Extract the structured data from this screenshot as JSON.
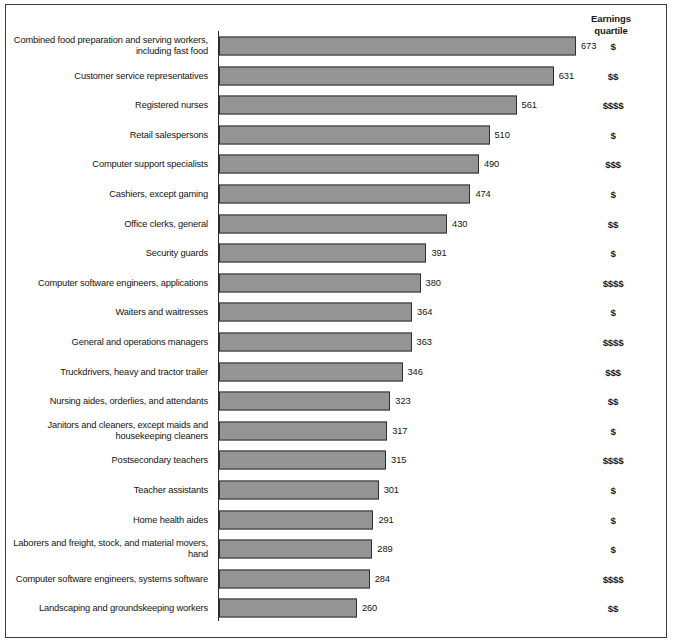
{
  "header": {
    "quartile_column_line1": "Earnings",
    "quartile_column_line2": "quartile"
  },
  "colors": {
    "bar_fill": "#949494",
    "bar_border": "#2f2f2f",
    "frame": "#3c3c3c",
    "text": "#151515"
  },
  "chart_data": {
    "type": "bar",
    "orientation": "horizontal",
    "title": "",
    "xlabel": "",
    "ylabel": "",
    "xlim": [
      0,
      700
    ],
    "grid": false,
    "legend": null,
    "categories": [
      "Combined food preparation and serving workers, including fast food",
      "Customer service representatives",
      "Registered nurses",
      "Retail salespersons",
      "Computer support specialists",
      "Cashiers, except gaming",
      "Office clerks, general",
      "Security guards",
      "Computer software engineers, applications",
      "Waiters and waitresses",
      "General and operations managers",
      "Truckdrivers, heavy and tractor trailer",
      "Nursing aides, orderlies, and attendants",
      "Janitors and cleaners, except maids and housekeeping cleaners",
      "Postsecondary teachers",
      "Teacher assistants",
      "Home health aides",
      "Laborers and  freight, stock, and material movers, hand",
      "Computer software engineers, systems software",
      "Landscaping and groundskeeping workers"
    ],
    "values": [
      673,
      631,
      561,
      510,
      490,
      474,
      430,
      391,
      380,
      364,
      363,
      346,
      323,
      317,
      315,
      301,
      291,
      289,
      284,
      260
    ],
    "quartiles": [
      "$",
      "$$",
      "$$$$",
      "$",
      "$$$",
      "$",
      "$$",
      "$",
      "$$$$",
      "$",
      "$$$$",
      "$$$",
      "$$",
      "$",
      "$$$$",
      "$",
      "$",
      "$",
      "$$$$",
      "$$"
    ]
  },
  "footnote": {
    "text": ""
  }
}
